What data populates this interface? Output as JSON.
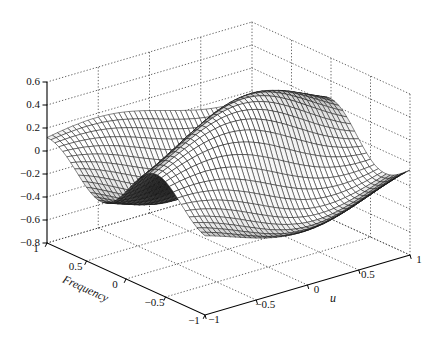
{
  "chart_data": {
    "type": "surface",
    "title": "",
    "xlabel": "u",
    "ylabel": "Frequency",
    "zlabel": "",
    "x_range": [
      -1,
      1
    ],
    "y_range": [
      -1,
      1
    ],
    "z_range": [
      -0.8,
      0.6
    ],
    "x_tick_values": [
      -1,
      -0.5,
      0,
      0.5,
      1
    ],
    "x_tick_labels": [
      "−1",
      "−0.5",
      "0",
      "0.5",
      "1"
    ],
    "y_tick_values": [
      1,
      0.5,
      0,
      -0.5,
      -1
    ],
    "y_tick_labels": [
      "1",
      "0.5",
      "0",
      "−0.5",
      "−1"
    ],
    "z_tick_values": [
      0.6,
      0.4,
      0.2,
      0,
      -0.2,
      -0.4,
      -0.6,
      -0.8
    ],
    "z_tick_labels": [
      "0.6",
      "0.4",
      "0.2",
      "0",
      "−0.2",
      "−0.4",
      "−0.6",
      "−0.8"
    ],
    "grid": "dotted",
    "legend": "none",
    "view": {
      "azimuth": -37.5,
      "elevation": 30
    },
    "surface": {
      "description": "Lit gray mesh: z(u,f) = amp*exp(-(du*u^2+df*(f-f0)^2))*cos(kf*f+ku*u+phase); oscillating ridge peaking near +0.55 at (u=0.1, f=-0.15), trough near -0.45 at (u=0, f=0.5), broad front valley near f=-0.8, decaying to ~0 at domain corners",
      "amp": 0.58,
      "du": 0.85,
      "df": 0.62,
      "f0": -0.05,
      "kf": 4.2,
      "ku": -0.9,
      "phase": 0.83,
      "grid_divisions": 40
    },
    "lighting": {
      "direction": [
        -0.55,
        -0.75,
        0.55
      ],
      "ambient": 0.4,
      "diffuse": 0.78,
      "gradient_gain": 1.15
    },
    "colors": {
      "background": "#ffffff",
      "axis": "#000000",
      "grid_line": "#3c3c3c",
      "mesh_edge": "#121212",
      "label": "#111111"
    }
  }
}
